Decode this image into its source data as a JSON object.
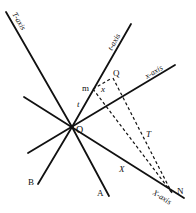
{
  "diagram": {
    "type": "spacetime-axes",
    "colors": {
      "ink": "#111111",
      "background": "#ffffff"
    },
    "points": {
      "origin": "O",
      "m": "m",
      "Q": "Q",
      "N": "N",
      "A": "A",
      "B": "B"
    },
    "axis_labels": {
      "T_axis": "T-axis",
      "t_axis": "t-axis",
      "x_axis": "x-axis",
      "X_axis": "X-axis"
    },
    "segment_labels": {
      "t": "t",
      "x": "x",
      "T": "T",
      "X": "X"
    }
  }
}
